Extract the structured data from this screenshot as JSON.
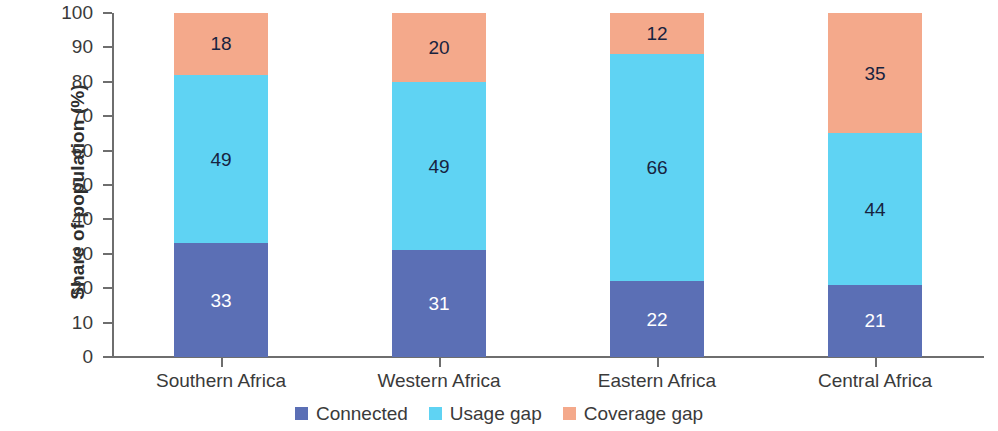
{
  "chart_data": {
    "type": "bar",
    "subtype": "stacked-bar-100-percent",
    "title": "",
    "subtitle": "",
    "xlabel": "",
    "ylabel": "Share of population (%)",
    "ylim": [
      0,
      100
    ],
    "yticks": [
      0,
      10,
      20,
      30,
      40,
      50,
      60,
      70,
      80,
      90,
      100
    ],
    "ytick_labels": [
      "0",
      "10",
      "20",
      "30",
      "40",
      "50",
      "60",
      "70",
      "80",
      "90",
      "100"
    ],
    "grid": false,
    "legend_position": "bottom-center",
    "categories": [
      "Southern Africa",
      "Western Africa",
      "Eastern Africa",
      "Central Africa"
    ],
    "series": [
      {
        "name": "Connected",
        "color": "#5b6fb5",
        "label_color": "#ffffff",
        "values": [
          33,
          31,
          22,
          21
        ],
        "value_labels": [
          "33",
          "31",
          "22",
          "21"
        ]
      },
      {
        "name": "Usage gap",
        "color": "#5fd3f3",
        "label_color": "#17233f",
        "values": [
          49,
          49,
          66,
          44
        ],
        "value_labels": [
          "49",
          "49",
          "66",
          "44"
        ]
      },
      {
        "name": "Coverage gap",
        "color": "#f4a98b",
        "label_color": "#17233f",
        "values": [
          18,
          20,
          12,
          35
        ],
        "value_labels": [
          "18",
          "20",
          "12",
          "35"
        ]
      }
    ]
  },
  "axes": {
    "y_title": "Share of population (%)"
  },
  "legend": {
    "items": [
      {
        "label": "Connected",
        "color": "#5b6fb5"
      },
      {
        "label": "Usage gap",
        "color": "#5fd3f3"
      },
      {
        "label": "Coverage gap",
        "color": "#f4a98b"
      }
    ]
  }
}
